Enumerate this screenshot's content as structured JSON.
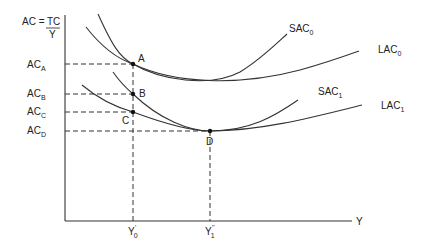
{
  "diagram": {
    "y_axis_label": {
      "left": "AC =",
      "numerator": "TC",
      "denominator": "Y"
    },
    "x_axis_label": "Y",
    "y_ticks": [
      {
        "base": "AC",
        "sub": "A"
      },
      {
        "base": "AC",
        "sub": "B"
      },
      {
        "base": "AC",
        "sub": "C"
      },
      {
        "base": "AC",
        "sub": "D"
      }
    ],
    "x_ticks": [
      {
        "base": "Y",
        "sub": "0",
        "sup": "'"
      },
      {
        "base": "Y",
        "sub": "1",
        "sup": "''"
      }
    ],
    "curves": [
      {
        "base": "SAC",
        "sub": "0"
      },
      {
        "base": "LAC",
        "sub": "0"
      },
      {
        "base": "SAC",
        "sub": "1"
      },
      {
        "base": "LAC",
        "sub": "1"
      }
    ],
    "points": [
      "A",
      "B",
      "C",
      "D"
    ]
  }
}
